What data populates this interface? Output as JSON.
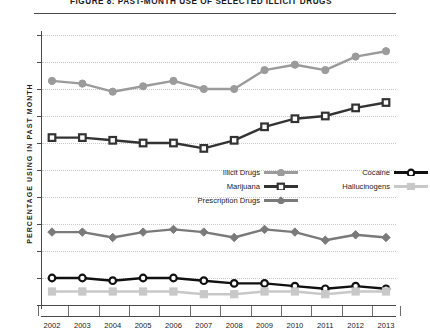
{
  "figure": {
    "title": "FIGURE 8: PAST-MONTH USE OF SELECTED ILLICIT DRUGS"
  },
  "chart_data": {
    "type": "line",
    "title": "FIGURE 8: PAST-MONTH USE OF SELECTED ILLICIT DRUGS",
    "xlabel": "",
    "ylabel": "PERCENTAGE USING IN PAST MONTH",
    "ylim": [
      0,
      10
    ],
    "xlim": [
      2002,
      2013
    ],
    "grid": true,
    "legend_position": "inside-center",
    "categories": [
      "2002",
      "2003",
      "2004",
      "2005",
      "2006",
      "2007",
      "2008",
      "2009",
      "2010",
      "2011",
      "2012",
      "2013"
    ],
    "yticks": [
      "0",
      "1",
      "2",
      "3",
      "4",
      "5",
      "6",
      "7",
      "8",
      "9",
      "10"
    ],
    "series": [
      {
        "name": "Illicit Drugs",
        "color": "#9b9b9b",
        "marker": "circle-filled",
        "values": [
          8.3,
          8.2,
          7.9,
          8.1,
          8.3,
          8.0,
          8.0,
          8.7,
          8.9,
          8.7,
          9.2,
          9.4
        ]
      },
      {
        "name": "Marijuana",
        "color": "#333333",
        "marker": "square-open",
        "values": [
          6.2,
          6.2,
          6.1,
          6.0,
          6.0,
          5.8,
          6.1,
          6.6,
          6.9,
          7.0,
          7.3,
          7.5
        ]
      },
      {
        "name": "Prescription Drugs",
        "color": "#7a7a7a",
        "marker": "diamond-filled",
        "values": [
          2.7,
          2.7,
          2.5,
          2.7,
          2.8,
          2.7,
          2.5,
          2.8,
          2.7,
          2.4,
          2.6,
          2.5
        ]
      },
      {
        "name": "Cocaine",
        "color": "#111111",
        "marker": "circle-open",
        "values": [
          1.0,
          1.0,
          0.9,
          1.0,
          1.0,
          0.9,
          0.8,
          0.8,
          0.7,
          0.6,
          0.7,
          0.6
        ]
      },
      {
        "name": "Hallucinogens",
        "color": "#c8c8c8",
        "marker": "square-filled",
        "values": [
          0.5,
          0.5,
          0.5,
          0.5,
          0.5,
          0.4,
          0.4,
          0.5,
          0.5,
          0.4,
          0.5,
          0.5
        ]
      }
    ]
  },
  "legend": {
    "items": [
      {
        "label": "Illicit Drugs",
        "color": "#9b9b9b",
        "marker": "circle-filled"
      },
      {
        "label": "Marijuana",
        "color": "#333333",
        "marker": "square-open"
      },
      {
        "label": "Prescription Drugs",
        "color": "#7a7a7a",
        "marker": "diamond-filled"
      },
      {
        "label": "Cocaine",
        "color": "#111111",
        "marker": "circle-open"
      },
      {
        "label": "Hallucinogens",
        "color": "#c8c8c8",
        "marker": "square-filled"
      }
    ]
  },
  "colors": {
    "axis": "#4a4a4a",
    "grid": "#c9c9c9",
    "text": "#222222",
    "background": "#ffffff"
  }
}
